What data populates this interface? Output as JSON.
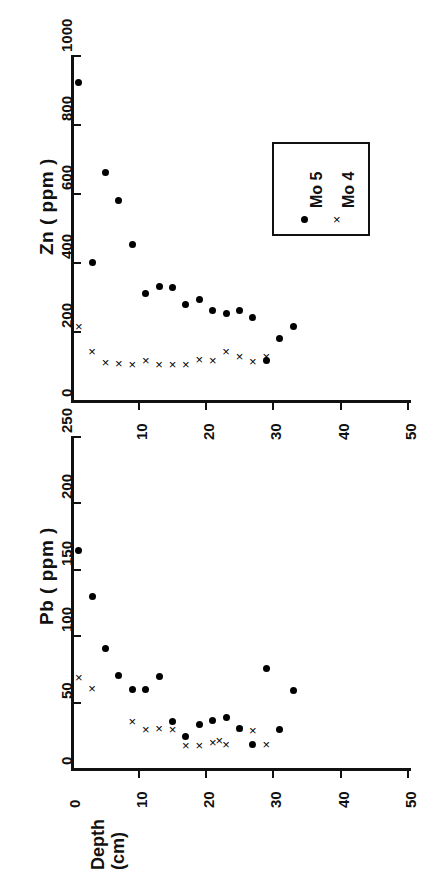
{
  "figure": {
    "background_color": "#ffffff",
    "ink_color": "#111111",
    "orientation_note": "rotated-90",
    "panels": [
      "zn-panel",
      "pb-panel"
    ]
  },
  "legend": {
    "entries": [
      {
        "label": "Mo 5",
        "marker": "filled-circle"
      },
      {
        "label": "Mo 4",
        "marker": "cross"
      }
    ]
  },
  "chart_data": [
    {
      "id": "zn-panel",
      "type": "scatter",
      "title": "",
      "xlabel": "Depth (cm)",
      "ylabel": "Zn ( ppm )",
      "xlim": [
        0,
        50
      ],
      "ylim": [
        0,
        1000
      ],
      "xticks": [
        0,
        10,
        20,
        30,
        40,
        50
      ],
      "xticklabels": [
        "0",
        "10",
        "20",
        "30",
        "40",
        "50"
      ],
      "yticks": [
        0,
        200,
        400,
        600,
        800,
        1000
      ],
      "yticklabels": [
        "0",
        "200",
        "400",
        "600",
        "800",
        "1000"
      ],
      "grid": false,
      "legend_position": "upper-right",
      "series": [
        {
          "name": "Mo 5",
          "marker": "filled-circle",
          "x": [
            1,
            3,
            5,
            7,
            9,
            11,
            13,
            15,
            17,
            19,
            21,
            23,
            25,
            27,
            29,
            31,
            33
          ],
          "y": [
            920,
            398,
            658,
            578,
            452,
            310,
            328,
            327,
            278,
            292,
            258,
            251,
            260,
            240,
            115,
            178,
            212
          ]
        },
        {
          "name": "Mo 4",
          "marker": "cross",
          "x": [
            1,
            3,
            5,
            7,
            9,
            11,
            13,
            15,
            17,
            19,
            21,
            23,
            25,
            27,
            29
          ],
          "y": [
            213,
            140,
            110,
            105,
            103,
            115,
            103,
            104,
            104,
            118,
            115,
            142,
            125,
            112,
            125
          ]
        }
      ]
    },
    {
      "id": "pb-panel",
      "type": "scatter",
      "title": "",
      "xlabel": "Depth (cm)",
      "ylabel": "Pb ( ppm )",
      "xlim": [
        0,
        50
      ],
      "ylim": [
        0,
        250
      ],
      "xticks": [
        0,
        10,
        20,
        30,
        40,
        50
      ],
      "xticklabels": [
        "0",
        "10",
        "20",
        "30",
        "40",
        "50"
      ],
      "yticks": [
        0,
        50,
        100,
        150,
        200,
        250
      ],
      "yticklabels": [
        "0",
        "50",
        "100",
        "150",
        "200",
        "250"
      ],
      "grid": false,
      "legend_position": "none",
      "series": [
        {
          "name": "Mo 5",
          "marker": "filled-circle",
          "x": [
            1,
            3,
            5,
            7,
            9,
            11,
            13,
            15,
            17,
            19,
            21,
            23,
            25,
            27,
            29,
            31,
            33
          ],
          "y": [
            164,
            129,
            90,
            70,
            59,
            59,
            69,
            35,
            24,
            33,
            36,
            38,
            30,
            18,
            75,
            29,
            58
          ]
        },
        {
          "name": "Mo 4",
          "marker": "cross",
          "x": [
            1,
            3,
            9,
            11,
            13,
            15,
            17,
            19,
            21,
            22,
            23,
            25,
            27,
            29
          ],
          "y": [
            68,
            60,
            35,
            29,
            30,
            29,
            17,
            17,
            19,
            21,
            18,
            30,
            28,
            18
          ]
        }
      ]
    }
  ],
  "axis_titles": {
    "zn": "Zn ( ppm )",
    "pb": "Pb ( ppm )",
    "depth_line1": "Depth",
    "depth_line2": "(cm)"
  }
}
